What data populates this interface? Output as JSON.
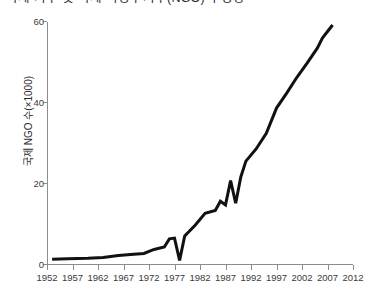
{
  "chart_data": {
    "type": "line",
    "title": "국제 기구 및 국제 비정부기구(NGO)의 성장",
    "xlabel": "",
    "ylabel": "국제 NGO 수(×1000)",
    "xlim": [
      1952,
      2012
    ],
    "ylim": [
      0,
      60
    ],
    "grid": false,
    "legend": "none",
    "x_ticks": [
      1952,
      1957,
      1962,
      1967,
      1972,
      1977,
      1982,
      1987,
      1992,
      1997,
      2002,
      2007,
      2012
    ],
    "y_ticks": [
      0,
      20,
      40,
      60
    ],
    "line_color": "#111111",
    "line_width": 3,
    "series": [
      {
        "name": "국제 NGO 수(×1000)",
        "x": [
          1953,
          1956,
          1960,
          1963,
          1966,
          1969,
          1971,
          1973,
          1975,
          1976,
          1977,
          1978,
          1979,
          1981,
          1983,
          1985,
          1986,
          1987,
          1988,
          1989,
          1990,
          1991,
          1993,
          1995,
          1997,
          1999,
          2001,
          2003,
          2005,
          2006,
          2007,
          2008
        ],
        "y": [
          1.2,
          1.3,
          1.4,
          1.6,
          2.1,
          2.4,
          2.6,
          3.6,
          4.2,
          6.2,
          6.4,
          0.9,
          6.9,
          9.5,
          12.5,
          13.2,
          15.5,
          14.6,
          20.6,
          15.0,
          21.5,
          25.4,
          28.4,
          32.3,
          38.5,
          42.2,
          46.1,
          49.6,
          53.3,
          55.8,
          57.4,
          59.0
        ]
      }
    ]
  },
  "axis": {
    "y_tick_labels": [
      "0",
      "20",
      "40",
      "60"
    ],
    "x_tick_labels": [
      "1952",
      "1957",
      "1962",
      "1967",
      "1972",
      "1977",
      "1982",
      "1987",
      "1992",
      "1997",
      "2002",
      "2007",
      "2012"
    ]
  }
}
